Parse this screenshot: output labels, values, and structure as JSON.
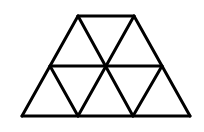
{
  "diagram": {
    "type": "trapezoid subdivided into equilateral triangles",
    "background": "#ffffff",
    "stroke_color": "#000000",
    "stroke_width": 3,
    "rows": 2,
    "triangle_count": 8,
    "vertices": {
      "top": [
        [
          78,
          16
        ],
        [
          134,
          16
        ]
      ],
      "middle": [
        [
          50,
          66
        ],
        [
          106,
          66
        ],
        [
          162,
          66
        ]
      ],
      "bottom": [
        [
          22,
          116
        ],
        [
          78,
          116
        ],
        [
          133,
          116
        ],
        [
          190,
          116
        ]
      ]
    },
    "edges": [
      [
        [
          78,
          16
        ],
        [
          134,
          16
        ]
      ],
      [
        [
          50,
          66
        ],
        [
          162,
          66
        ]
      ],
      [
        [
          22,
          116
        ],
        [
          190,
          116
        ]
      ],
      [
        [
          78,
          16
        ],
        [
          22,
          116
        ]
      ],
      [
        [
          134,
          16
        ],
        [
          190,
          116
        ]
      ],
      [
        [
          78,
          16
        ],
        [
          133,
          116
        ]
      ],
      [
        [
          134,
          16
        ],
        [
          78,
          116
        ]
      ],
      [
        [
          50,
          66
        ],
        [
          78,
          116
        ]
      ],
      [
        [
          162,
          66
        ],
        [
          133,
          116
        ]
      ]
    ]
  }
}
